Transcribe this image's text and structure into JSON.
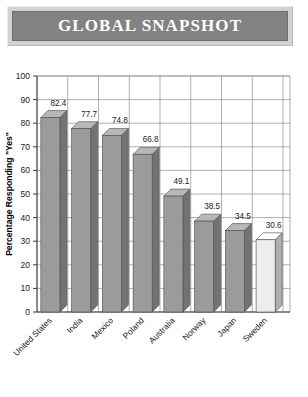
{
  "banner": {
    "title": "GLOBAL SNAPSHOT"
  },
  "chart_data": {
    "type": "bar",
    "title": "GLOBAL SNAPSHOT",
    "xlabel": "",
    "ylabel": "Percentage Responding \"Yes\"",
    "categories": [
      "United States",
      "India",
      "Mexico",
      "Poland",
      "Australia",
      "Norway",
      "Japan",
      "Sweden"
    ],
    "values": [
      82.4,
      77.7,
      74.8,
      66.8,
      49.1,
      38.5,
      34.5,
      30.6
    ],
    "value_labels": [
      "82.4",
      "77.7",
      "74.8",
      "66.8",
      "49.1",
      "38.5",
      "34.5",
      "30.6"
    ],
    "ylim": [
      0,
      100
    ],
    "ytick_labels": [
      "100",
      "90",
      "80",
      "70",
      "60",
      "50",
      "40",
      "30",
      "20",
      "10",
      "0"
    ],
    "ytick_values": [
      100,
      90,
      80,
      70,
      60,
      50,
      40,
      30,
      20,
      10,
      0
    ],
    "grid": true,
    "legend": "none",
    "style": "3d-bars",
    "bar_colors": [
      "#9b9b9b",
      "#9b9b9b",
      "#9b9b9b",
      "#9b9b9b",
      "#9b9b9b",
      "#9b9b9b",
      "#9b9b9b",
      "#ededed"
    ],
    "accent_color": "#828282",
    "grid_color": "#8d8d8d"
  }
}
